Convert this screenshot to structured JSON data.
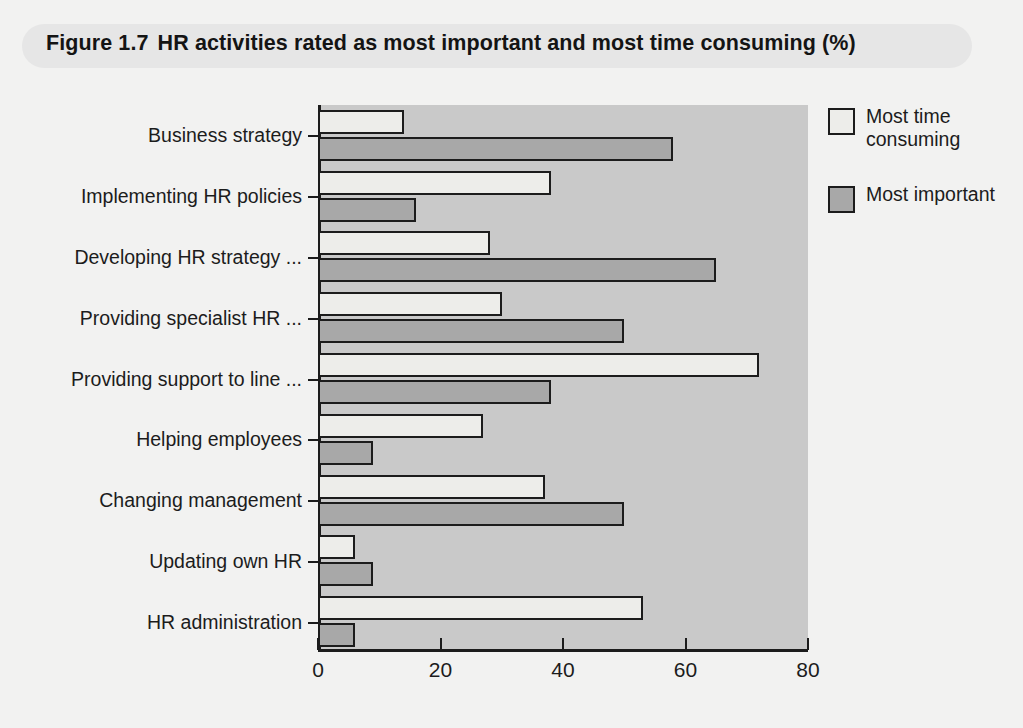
{
  "figure": {
    "number": "Figure 1.7",
    "title": "HR activities rated as most important and most time consuming (%)"
  },
  "legend": {
    "position": "right",
    "items": [
      {
        "label": "Most time consuming",
        "color": "#ededea",
        "swatch": "legend-swatch-time-consuming"
      },
      {
        "label": "Most important",
        "color": "#a8a8a8",
        "swatch": "legend-swatch-most-important"
      }
    ]
  },
  "axis": {
    "x_ticks": [
      "0",
      "20",
      "40",
      "60",
      "80"
    ],
    "x_min": 0,
    "x_max": 80
  },
  "chart_data": {
    "type": "bar",
    "orientation": "horizontal",
    "xlabel": "",
    "ylabel": "",
    "xlim": [
      0,
      80
    ],
    "grid": false,
    "legend_position": "right",
    "categories": [
      "Business strategy",
      "Implementing HR policies",
      "Developing HR strategy ...",
      "Providing specialist HR ...",
      "Providing support to line ...",
      "Helping employees",
      "Changing management",
      "Updating own HR",
      "HR administration"
    ],
    "series": [
      {
        "name": "Most time consuming",
        "color": "#ededea",
        "values": [
          14,
          38,
          28,
          30,
          72,
          27,
          37,
          6,
          53
        ]
      },
      {
        "name": "Most important",
        "color": "#a8a8a8",
        "values": [
          58,
          16,
          65,
          50,
          38,
          9,
          50,
          9,
          6
        ]
      }
    ]
  }
}
